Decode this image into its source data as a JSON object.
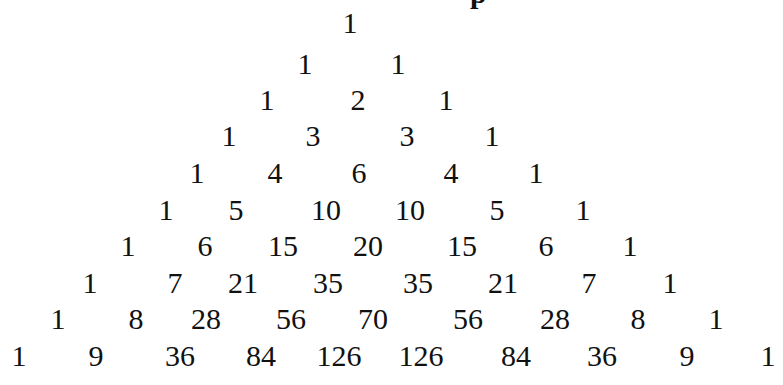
{
  "diagram": {
    "type": "pascals-triangle",
    "clipped_title_fragment": "p",
    "rows": [
      {
        "y": 8,
        "cells": [
          {
            "v": "1",
            "x": 350
          }
        ]
      },
      {
        "y": 49,
        "cells": [
          {
            "v": "1",
            "x": 305
          },
          {
            "v": "1",
            "x": 398
          }
        ]
      },
      {
        "y": 85,
        "cells": [
          {
            "v": "1",
            "x": 267
          },
          {
            "v": "2",
            "x": 358
          },
          {
            "v": "1",
            "x": 446
          }
        ]
      },
      {
        "y": 121,
        "cells": [
          {
            "v": "1",
            "x": 229
          },
          {
            "v": "3",
            "x": 313
          },
          {
            "v": "3",
            "x": 407
          },
          {
            "v": "1",
            "x": 492
          }
        ]
      },
      {
        "y": 158,
        "cells": [
          {
            "v": "1",
            "x": 197
          },
          {
            "v": "4",
            "x": 275
          },
          {
            "v": "6",
            "x": 359
          },
          {
            "v": "4",
            "x": 451
          },
          {
            "v": "1",
            "x": 536
          }
        ]
      },
      {
        "y": 195,
        "cells": [
          {
            "v": "1",
            "x": 166
          },
          {
            "v": "5",
            "x": 236
          },
          {
            "v": "10",
            "x": 326
          },
          {
            "v": "10",
            "x": 410
          },
          {
            "v": "5",
            "x": 497
          },
          {
            "v": "1",
            "x": 583
          }
        ]
      },
      {
        "y": 231,
        "cells": [
          {
            "v": "1",
            "x": 128
          },
          {
            "v": "6",
            "x": 205
          },
          {
            "v": "15",
            "x": 283
          },
          {
            "v": "20",
            "x": 368
          },
          {
            "v": "15",
            "x": 462
          },
          {
            "v": "6",
            "x": 546
          },
          {
            "v": "1",
            "x": 630
          }
        ]
      },
      {
        "y": 268,
        "cells": [
          {
            "v": "1",
            "x": 90
          },
          {
            "v": "7",
            "x": 175
          },
          {
            "v": "21",
            "x": 243
          },
          {
            "v": "35",
            "x": 328
          },
          {
            "v": "35",
            "x": 418
          },
          {
            "v": "21",
            "x": 503
          },
          {
            "v": "7",
            "x": 589
          },
          {
            "v": "1",
            "x": 670
          }
        ]
      },
      {
        "y": 304,
        "cells": [
          {
            "v": "1",
            "x": 58
          },
          {
            "v": "8",
            "x": 136
          },
          {
            "v": "28",
            "x": 206
          },
          {
            "v": "56",
            "x": 291
          },
          {
            "v": "70",
            "x": 373
          },
          {
            "v": "56",
            "x": 468
          },
          {
            "v": "28",
            "x": 555
          },
          {
            "v": "8",
            "x": 638
          },
          {
            "v": "1",
            "x": 716
          }
        ]
      },
      {
        "y": 341,
        "cells": [
          {
            "v": "1",
            "x": 19
          },
          {
            "v": "9",
            "x": 96
          },
          {
            "v": "36",
            "x": 180
          },
          {
            "v": "84",
            "x": 261
          },
          {
            "v": "126",
            "x": 339
          },
          {
            "v": "126",
            "x": 421
          },
          {
            "v": "84",
            "x": 516
          },
          {
            "v": "36",
            "x": 602
          },
          {
            "v": "9",
            "x": 687
          },
          {
            "v": "1",
            "x": 768
          }
        ]
      }
    ]
  }
}
